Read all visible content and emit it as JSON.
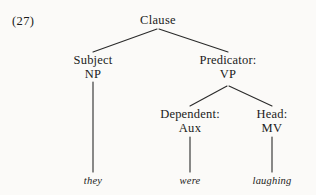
{
  "figure": {
    "example_number": "(27)",
    "ink_color": "#2a2a2a",
    "background_color": "#fbfaf8"
  },
  "tree": {
    "root": {
      "label": "Clause"
    },
    "nodes": [
      {
        "function_label": "Subject",
        "category": "NP"
      },
      {
        "function_label": "Predicator:",
        "category": "VP"
      },
      {
        "function_label": "Dependent:",
        "category": "Aux"
      },
      {
        "function_label": "Head:",
        "category": "MV"
      }
    ],
    "terminals": [
      {
        "word": "they"
      },
      {
        "word": "were"
      },
      {
        "word": "laughing"
      }
    ]
  }
}
